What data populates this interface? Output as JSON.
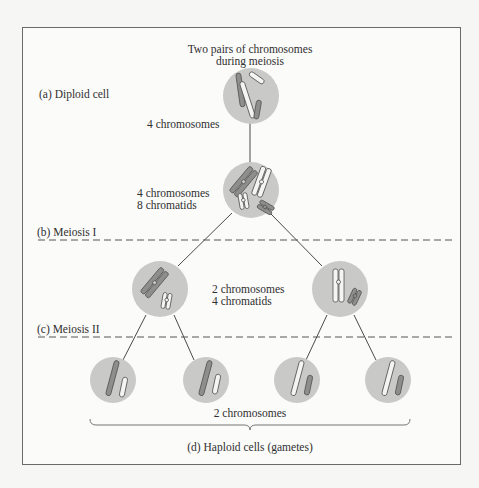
{
  "figure": {
    "title_line1": "Two pairs of chromosomes",
    "title_line2": "during meiosis"
  },
  "stages": {
    "a": {
      "label": "(a) Diploid cell",
      "count": "4 chromosomes"
    },
    "b": {
      "label": "(b) Meiosis I",
      "count_line1": "4 chromosomes",
      "count_line2": "8 chromatids"
    },
    "c": {
      "label": "(c) Meiosis II",
      "count_line1": "2 chromosomes",
      "count_line2": "4 chromatids"
    },
    "d": {
      "label": "(d) Haploid cells (gametes)",
      "count": "2 chromosomes"
    }
  },
  "colors": {
    "cell_fill": "#c9c9c7",
    "line": "#4a4a4a",
    "chromosome_dark": "#8e8e8c",
    "chromosome_light": "#f4f4f2"
  }
}
